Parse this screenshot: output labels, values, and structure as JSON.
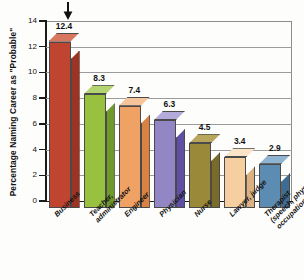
{
  "chart_data": {
    "type": "bar",
    "title": "",
    "xlabel": "",
    "ylabel": "Percentage Naming Career as \"Probable\"",
    "ylim": [
      0,
      14
    ],
    "yticks": [
      0,
      2,
      4,
      6,
      8,
      10,
      12,
      14
    ],
    "grid": true,
    "legend": "none",
    "categories": [
      "Business",
      "Teacher,\nadministrator",
      "Engineer",
      "Physician",
      "Nurse",
      "Lawyer, judge",
      "Therapist\n(speech, physical,\noccupational)"
    ],
    "values": [
      12.4,
      8.3,
      7.4,
      6.3,
      4.5,
      3.4,
      2.9
    ],
    "value_labels": [
      "12.4",
      "8.3",
      "7.4",
      "6.3",
      "4.5",
      "3.4",
      "2.9"
    ],
    "colors": [
      "#bf4530",
      "#97c13f",
      "#f0a264",
      "#9287c4",
      "#9a8939",
      "#f5cfa0",
      "#5d8cb3"
    ],
    "colors_side": [
      "#9c3323",
      "#6f9a2b",
      "#d98241",
      "#5f50a6",
      "#7a6b28",
      "#dbb181",
      "#3f6c93"
    ],
    "colors_top": [
      "#d8765f",
      "#b3d470",
      "#f6c49a",
      "#b4abdb",
      "#b8a65c",
      "#fae3c6",
      "#8fb4d1"
    ],
    "annotations": [
      {
        "name": "down-arrow",
        "target_category": "Business",
        "symbol": "↓"
      }
    ]
  }
}
